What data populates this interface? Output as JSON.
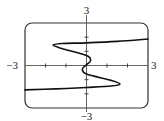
{
  "chart_data": {
    "type": "line",
    "title": "",
    "xlabel": "",
    "ylabel": "",
    "xlim": [
      -3,
      3
    ],
    "ylim": [
      -3,
      3
    ],
    "grid": false,
    "tick_labels": {
      "x_min": "−3",
      "x_max": "3",
      "y_min": "−3",
      "y_max": "3"
    },
    "x_ticks": [
      -3,
      -2,
      -1,
      0,
      1,
      2,
      3
    ],
    "y_ticks": [
      -3,
      -2,
      -1,
      0,
      1,
      2,
      3
    ],
    "series": [
      {
        "name": "curve",
        "description": "S-shaped curve with x as a function of y; upper branch extends right, lower branch extends left, with lobes near (-1.6, 1.4) and (1.6, -1.3) and a small wiggle near the origin",
        "points": [
          {
            "x": 3.0,
            "y": 1.87
          },
          {
            "x": 1.5,
            "y": 1.7
          },
          {
            "x": 0.0,
            "y": 1.6
          },
          {
            "x": -1.2,
            "y": 1.55
          },
          {
            "x": -1.63,
            "y": 1.44
          },
          {
            "x": -1.2,
            "y": 1.2
          },
          {
            "x": 0.0,
            "y": 0.7
          },
          {
            "x": 0.2,
            "y": 0.35
          },
          {
            "x": 0.0,
            "y": 0.05
          },
          {
            "x": -0.2,
            "y": -0.25
          },
          {
            "x": 0.0,
            "y": -0.6
          },
          {
            "x": 1.2,
            "y": -1.05
          },
          {
            "x": 1.63,
            "y": -1.3
          },
          {
            "x": 1.2,
            "y": -1.45
          },
          {
            "x": 0.0,
            "y": -1.55
          },
          {
            "x": -1.5,
            "y": -1.65
          },
          {
            "x": -3.0,
            "y": -1.72
          }
        ]
      }
    ]
  }
}
